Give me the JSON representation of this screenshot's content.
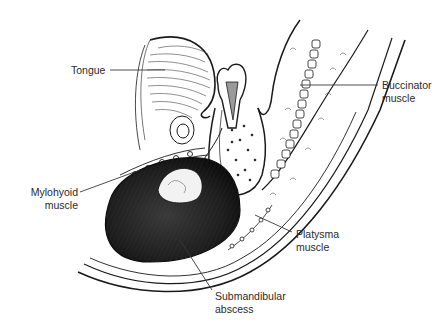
{
  "figure": {
    "type": "anatomical-illustration"
  },
  "labels": {
    "tongue": {
      "line1": "Tongue"
    },
    "buccinator": {
      "line1": "Buccinator",
      "line2": "muscle"
    },
    "mylohyoid": {
      "line1": "Mylohyoid",
      "line2": "muscle"
    },
    "platysma": {
      "line1": "Platysma",
      "line2": "muscle"
    },
    "abscess": {
      "line1": "Submandibular",
      "line2": "abscess"
    }
  },
  "colors": {
    "ink": "#1a1a1a",
    "label_text": "#2a2a2a",
    "leader_line": "#3a3a3a",
    "abscess_fill": "#1e1e1e",
    "background": "#ffffff"
  }
}
